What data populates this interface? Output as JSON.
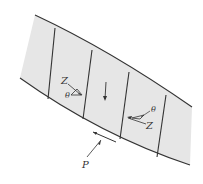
{
  "diagram": {
    "type": "slope-stability-method-of-slices",
    "colors": {
      "soil_fill": "#e6e6e6",
      "line": "#333333",
      "background": "#ffffff"
    },
    "labels": {
      "left_force": "Z",
      "left_angle": "θ",
      "right_force": "Z",
      "right_angle": "θ",
      "pore_pressure": "P"
    }
  }
}
